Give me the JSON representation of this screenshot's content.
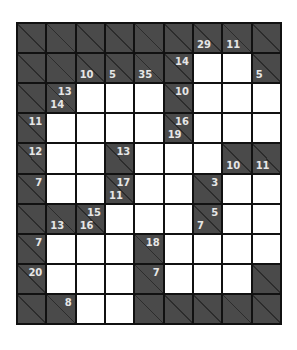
{
  "puzzle": {
    "type": "kakuro",
    "rows": 10,
    "cols": 9,
    "colors": {
      "block": "#4a4a4a",
      "diagonal": "#2c2c2c",
      "grid_line": "#111111",
      "empty": "#ffffff",
      "clue_text": "#e6e6e6"
    },
    "grid": [
      [
        {
          "t": "B"
        },
        {
          "t": "B"
        },
        {
          "t": "B"
        },
        {
          "t": "B"
        },
        {
          "t": "B"
        },
        {
          "t": "B"
        },
        {
          "t": "B",
          "down": "29"
        },
        {
          "t": "B",
          "down": "11"
        },
        {
          "t": "B"
        }
      ],
      [
        {
          "t": "B"
        },
        {
          "t": "B"
        },
        {
          "t": "B",
          "down": "10"
        },
        {
          "t": "B",
          "down": "5"
        },
        {
          "t": "B",
          "down": "35"
        },
        {
          "t": "B",
          "across": "14"
        },
        {
          "t": "W"
        },
        {
          "t": "W"
        },
        {
          "t": "B",
          "down": "5"
        }
      ],
      [
        {
          "t": "B"
        },
        {
          "t": "B",
          "across": "13",
          "down": "14"
        },
        {
          "t": "W"
        },
        {
          "t": "W"
        },
        {
          "t": "W"
        },
        {
          "t": "B",
          "across": "10"
        },
        {
          "t": "W"
        },
        {
          "t": "W"
        },
        {
          "t": "W"
        }
      ],
      [
        {
          "t": "B",
          "across": "11"
        },
        {
          "t": "W"
        },
        {
          "t": "W"
        },
        {
          "t": "W"
        },
        {
          "t": "W"
        },
        {
          "t": "B",
          "across": "16",
          "down": "19"
        },
        {
          "t": "W"
        },
        {
          "t": "W"
        },
        {
          "t": "W"
        }
      ],
      [
        {
          "t": "B",
          "across": "12"
        },
        {
          "t": "W"
        },
        {
          "t": "W"
        },
        {
          "t": "B",
          "across": "13"
        },
        {
          "t": "W"
        },
        {
          "t": "W"
        },
        {
          "t": "W"
        },
        {
          "t": "B",
          "down": "10"
        },
        {
          "t": "B",
          "down": "11"
        }
      ],
      [
        {
          "t": "B",
          "across": "7"
        },
        {
          "t": "W"
        },
        {
          "t": "W"
        },
        {
          "t": "B",
          "across": "17",
          "down": "11"
        },
        {
          "t": "W"
        },
        {
          "t": "W"
        },
        {
          "t": "B",
          "across": "3"
        },
        {
          "t": "W"
        },
        {
          "t": "W"
        }
      ],
      [
        {
          "t": "B"
        },
        {
          "t": "B",
          "down": "13"
        },
        {
          "t": "B",
          "across": "15",
          "down": "16"
        },
        {
          "t": "W"
        },
        {
          "t": "W"
        },
        {
          "t": "W"
        },
        {
          "t": "B",
          "across": "5",
          "down": "7"
        },
        {
          "t": "W"
        },
        {
          "t": "W"
        }
      ],
      [
        {
          "t": "B",
          "across": "7"
        },
        {
          "t": "W"
        },
        {
          "t": "W"
        },
        {
          "t": "W"
        },
        {
          "t": "B",
          "across": "18"
        },
        {
          "t": "W"
        },
        {
          "t": "W"
        },
        {
          "t": "W"
        },
        {
          "t": "W"
        }
      ],
      [
        {
          "t": "B",
          "across": "20"
        },
        {
          "t": "W"
        },
        {
          "t": "W"
        },
        {
          "t": "W"
        },
        {
          "t": "B",
          "across": "7"
        },
        {
          "t": "W"
        },
        {
          "t": "W"
        },
        {
          "t": "W"
        },
        {
          "t": "B"
        }
      ],
      [
        {
          "t": "B"
        },
        {
          "t": "B",
          "across": "8"
        },
        {
          "t": "W"
        },
        {
          "t": "W"
        },
        {
          "t": "B"
        },
        {
          "t": "B"
        },
        {
          "t": "B"
        },
        {
          "t": "B"
        },
        {
          "t": "B"
        }
      ]
    ]
  }
}
